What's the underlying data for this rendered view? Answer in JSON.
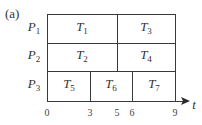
{
  "panel_label": "(a)",
  "axis": {
    "label": "t",
    "ticks": [
      "0",
      "3",
      "5",
      "6",
      "9"
    ]
  },
  "processors": [
    {
      "name": "P",
      "sub": "1"
    },
    {
      "name": "P",
      "sub": "2"
    },
    {
      "name": "P",
      "sub": "3"
    }
  ],
  "tasks": [
    {
      "name": "T",
      "sub": "1",
      "processor": "P1",
      "start": 0,
      "end": 5
    },
    {
      "name": "T",
      "sub": "3",
      "processor": "P1",
      "start": 5,
      "end": 9
    },
    {
      "name": "T",
      "sub": "2",
      "processor": "P2",
      "start": 0,
      "end": 5
    },
    {
      "name": "T",
      "sub": "4",
      "processor": "P2",
      "start": 5,
      "end": 9
    },
    {
      "name": "T",
      "sub": "5",
      "processor": "P3",
      "start": 0,
      "end": 3
    },
    {
      "name": "T",
      "sub": "6",
      "processor": "P3",
      "start": 3,
      "end": 6
    },
    {
      "name": "T",
      "sub": "7",
      "processor": "P3",
      "start": 6,
      "end": 9
    }
  ]
}
